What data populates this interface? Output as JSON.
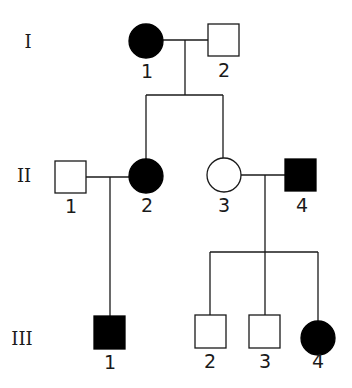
{
  "generations": [
    {
      "label": "I",
      "members": [
        {
          "id": "1",
          "sex": "female",
          "affected": true
        },
        {
          "id": "2",
          "sex": "male",
          "affected": false
        }
      ]
    },
    {
      "label": "II",
      "members": [
        {
          "id": "1",
          "sex": "male",
          "affected": false
        },
        {
          "id": "2",
          "sex": "female",
          "affected": true
        },
        {
          "id": "3",
          "sex": "female",
          "affected": false
        },
        {
          "id": "4",
          "sex": "male",
          "affected": true
        }
      ]
    },
    {
      "label": "III",
      "members": [
        {
          "id": "1",
          "sex": "male",
          "affected": true
        },
        {
          "id": "2",
          "sex": "male",
          "affected": false
        },
        {
          "id": "3",
          "sex": "male",
          "affected": false
        },
        {
          "id": "4",
          "sex": "female",
          "affected": true
        }
      ]
    }
  ],
  "relationships": [
    {
      "couple": [
        "I-1",
        "I-2"
      ],
      "children": [
        "II-2",
        "II-3"
      ]
    },
    {
      "couple": [
        "II-1",
        "II-2"
      ],
      "children": [
        "III-1"
      ]
    },
    {
      "couple": [
        "II-3",
        "II-4"
      ],
      "children": [
        "III-2",
        "III-3",
        "III-4"
      ]
    }
  ],
  "legend": {
    "filled": "affected",
    "open": "unaffected",
    "circle": "female",
    "square": "male"
  }
}
